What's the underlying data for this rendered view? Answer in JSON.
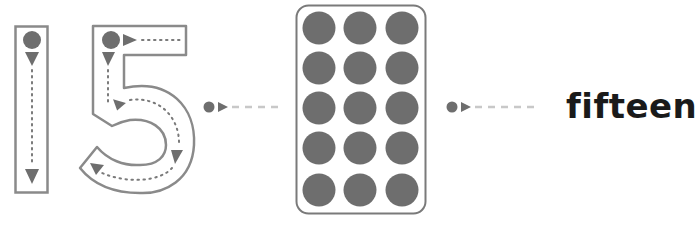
{
  "worksheet": {
    "numeral": "15",
    "digits": [
      "1",
      "5"
    ],
    "count": 15,
    "word": "fifteen",
    "frame": {
      "rows": 5,
      "cols": 3,
      "filled": 15
    }
  },
  "colors": {
    "outline": "#8a8a8a",
    "dot": "#6e6e6e",
    "dashes": "#c8c8c8",
    "text": "#1a1a1a",
    "background": "#ffffff"
  }
}
